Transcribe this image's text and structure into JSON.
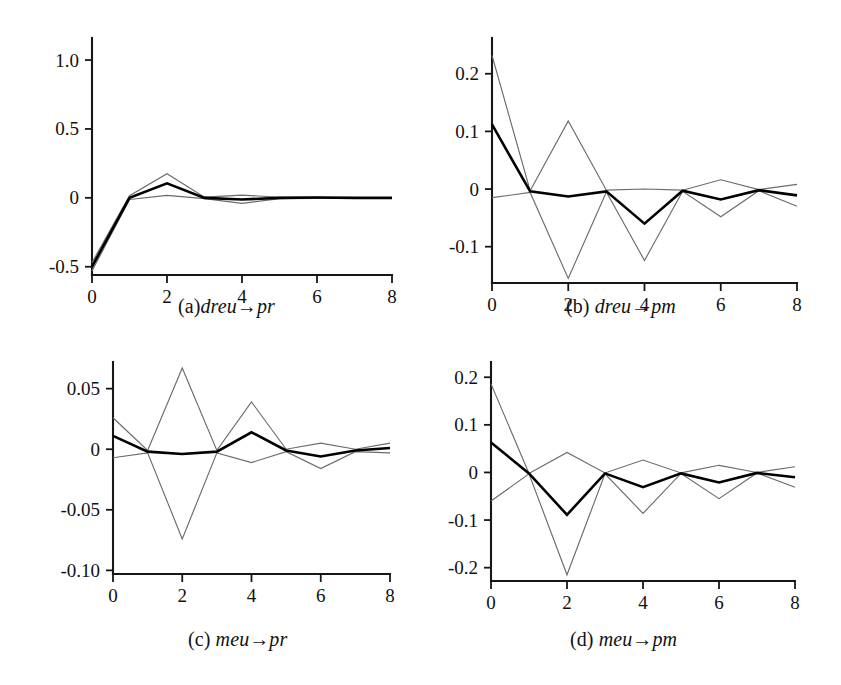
{
  "figure": {
    "background_color": "#ffffff",
    "panel_count": 4,
    "main_line_color": "#000000",
    "band_line_color": "#6b6b6b"
  },
  "chart_data": [
    {
      "type": "line",
      "panel_id": "a",
      "title": "(a)dreu→pr",
      "caption_prefix": "(a)",
      "caption_body": "dreu",
      "caption_arrow": "→",
      "caption_target": "pr",
      "xlabel": "",
      "ylabel": "",
      "x": [
        0,
        1,
        2,
        3,
        4,
        5,
        6,
        7,
        8
      ],
      "xlim": [
        0,
        8
      ],
      "ylim": [
        -0.56,
        1.16
      ],
      "xticks": [
        0,
        2,
        4,
        6,
        8
      ],
      "xtick_labels": [
        "0",
        "2",
        "4",
        "6",
        "8"
      ],
      "yticks": [
        1.0,
        0.5,
        0,
        -0.5
      ],
      "ytick_labels": [
        "1.0",
        "0.5",
        "0",
        "-0.5"
      ],
      "grid": false,
      "legend": "none",
      "series": [
        {
          "name": "point-estimate",
          "style": "thick-black",
          "values": [
            -0.5,
            0.0,
            0.105,
            0.0,
            -0.012,
            0.0,
            0.002,
            0.0,
            0.0
          ]
        },
        {
          "name": "upper-band",
          "style": "thin-gray",
          "values": [
            -0.47,
            0.015,
            0.175,
            0.005,
            0.02,
            0.004,
            0.004,
            0.001,
            0.001
          ]
        },
        {
          "name": "lower-band",
          "style": "thin-gray",
          "values": [
            -0.53,
            -0.012,
            0.018,
            -0.006,
            -0.04,
            -0.006,
            -0.004,
            -0.002,
            -0.001
          ]
        }
      ]
    },
    {
      "type": "line",
      "panel_id": "b",
      "title": "(b) dreu→pm",
      "caption_prefix": "(b)",
      "caption_body": "dreu",
      "caption_arrow": "→",
      "caption_target": "pm",
      "xlabel": "",
      "ylabel": "",
      "x": [
        0,
        1,
        2,
        3,
        4,
        5,
        6,
        7,
        8
      ],
      "xlim": [
        0,
        8
      ],
      "ylim": [
        -0.163,
        0.262
      ],
      "xticks": [
        0,
        2,
        4,
        6,
        8
      ],
      "xtick_labels": [
        "0",
        "2",
        "4",
        "6",
        "8"
      ],
      "yticks": [
        0.2,
        0.1,
        0,
        -0.1
      ],
      "ytick_labels": [
        "0.2",
        "0.1",
        "0",
        "-0.1"
      ],
      "grid": false,
      "legend": "none",
      "series": [
        {
          "name": "point-estimate",
          "style": "thick-black",
          "values": [
            0.112,
            -0.004,
            -0.013,
            -0.004,
            -0.06,
            -0.003,
            -0.018,
            -0.002,
            -0.011
          ]
        },
        {
          "name": "upper-band",
          "style": "thin-gray",
          "values": [
            0.232,
            -0.003,
            0.118,
            -0.002,
            0.0,
            -0.002,
            0.016,
            -0.001,
            0.008
          ]
        },
        {
          "name": "lower-band",
          "style": "thin-gray",
          "values": [
            -0.015,
            -0.006,
            -0.155,
            -0.005,
            -0.124,
            -0.004,
            -0.048,
            -0.003,
            -0.03
          ]
        }
      ]
    },
    {
      "type": "line",
      "panel_id": "c",
      "title": "(c) meu→pr",
      "caption_prefix": "(c)",
      "caption_body": "meu",
      "caption_arrow": "→",
      "caption_target": "pr",
      "xlabel": "",
      "ylabel": "",
      "x": [
        0,
        1,
        2,
        3,
        4,
        5,
        6,
        7,
        8
      ],
      "xlim": [
        0,
        8
      ],
      "ylim": [
        -0.103,
        0.072
      ],
      "xticks": [
        0,
        2,
        4,
        6,
        8
      ],
      "xtick_labels": [
        "0",
        "2",
        "4",
        "6",
        "8"
      ],
      "yticks": [
        0.05,
        0,
        -0.05,
        -0.1
      ],
      "ytick_labels": [
        "0.05",
        "0",
        "-0.05",
        "-0.10"
      ],
      "grid": false,
      "legend": "none",
      "series": [
        {
          "name": "point-estimate",
          "style": "thick-black",
          "values": [
            0.011,
            -0.002,
            -0.004,
            -0.002,
            0.014,
            -0.001,
            -0.006,
            -0.001,
            0.001
          ]
        },
        {
          "name": "upper-band",
          "style": "thin-gray",
          "values": [
            0.026,
            -0.001,
            0.067,
            -0.001,
            0.039,
            0.0,
            0.005,
            0.0,
            0.005
          ]
        },
        {
          "name": "lower-band",
          "style": "thin-gray",
          "values": [
            -0.007,
            -0.003,
            -0.074,
            -0.003,
            -0.011,
            -0.002,
            -0.016,
            -0.002,
            -0.003
          ]
        }
      ]
    },
    {
      "type": "line",
      "panel_id": "d",
      "title": "(d) meu→pm",
      "caption_prefix": "(d)",
      "caption_body": "meu",
      "caption_arrow": "→",
      "caption_target": "pm",
      "xlabel": "",
      "ylabel": "",
      "x": [
        0,
        1,
        2,
        3,
        4,
        5,
        6,
        7,
        8
      ],
      "xlim": [
        0,
        8
      ],
      "ylim": [
        -0.228,
        0.232
      ],
      "xticks": [
        0,
        2,
        4,
        6,
        8
      ],
      "xtick_labels": [
        "0",
        "2",
        "4",
        "6",
        "8"
      ],
      "yticks": [
        0.2,
        0.1,
        0,
        -0.1,
        -0.2
      ],
      "ytick_labels": [
        "0.2",
        "0.1",
        "0",
        "-0.1",
        "-0.2"
      ],
      "grid": false,
      "legend": "none",
      "series": [
        {
          "name": "point-estimate",
          "style": "thick-black",
          "values": [
            0.063,
            -0.002,
            -0.089,
            -0.002,
            -0.031,
            -0.002,
            -0.021,
            -0.001,
            -0.01
          ]
        },
        {
          "name": "upper-band",
          "style": "thin-gray",
          "values": [
            0.186,
            -0.002,
            0.042,
            -0.001,
            0.026,
            -0.001,
            0.015,
            0.0,
            0.012
          ]
        },
        {
          "name": "lower-band",
          "style": "thin-gray",
          "values": [
            -0.06,
            -0.003,
            -0.215,
            -0.003,
            -0.086,
            -0.002,
            -0.055,
            -0.001,
            -0.031
          ]
        }
      ]
    }
  ]
}
